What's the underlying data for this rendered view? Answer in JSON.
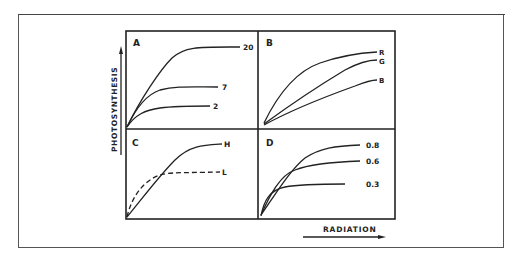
{
  "figure": {
    "y_axis_label": "PHOTOSYNTHESIS",
    "x_axis_label": "RADIATION",
    "panels": [
      {
        "id": "A",
        "label": "A",
        "curves": [
          {
            "label": "20",
            "style": "solid"
          },
          {
            "label": "7",
            "style": "solid"
          },
          {
            "label": "2",
            "style": "solid"
          }
        ]
      },
      {
        "id": "B",
        "label": "B",
        "curves": [
          {
            "label": "R",
            "style": "solid"
          },
          {
            "label": "G",
            "style": "solid"
          },
          {
            "label": "B",
            "style": "solid"
          }
        ]
      },
      {
        "id": "C",
        "label": "C",
        "curves": [
          {
            "label": "H",
            "style": "solid"
          },
          {
            "label": "L",
            "style": "dashed"
          }
        ]
      },
      {
        "id": "D",
        "label": "D",
        "curves": [
          {
            "label": "0.8",
            "style": "solid"
          },
          {
            "label": "0.6",
            "style": "solid"
          },
          {
            "label": "0.3",
            "style": "solid"
          }
        ]
      }
    ]
  },
  "colors": {
    "ink": "#222222",
    "background": "#ffffff"
  }
}
